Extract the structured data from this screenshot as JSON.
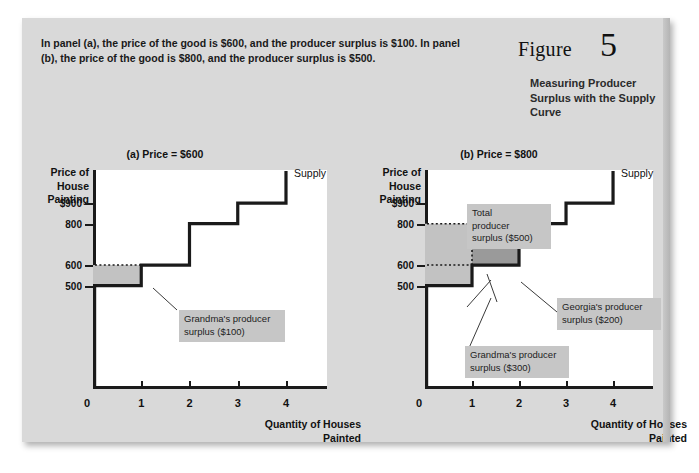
{
  "figure": {
    "label": "Figure",
    "number": "5",
    "title": "Measuring Producer Surplus with the Supply Curve",
    "caption": "In panel (a), the price of the good is $600, and the producer surplus is $100. In panel (b), the price of the good is $800, and the producer surplus is $500."
  },
  "chart_data": [
    {
      "type": "line",
      "title": "(a) Price = $600",
      "xlabel": "Quantity of Houses Painted",
      "ylabel": "Price of House Painting",
      "curve_label": "Supply",
      "xlim": [
        0,
        4.85
      ],
      "ylim": [
        0,
        1060
      ],
      "xticks": [
        "0",
        "1",
        "2",
        "3",
        "4"
      ],
      "xtick_values": [
        0,
        1,
        2,
        3,
        4
      ],
      "yticks": [
        "$900",
        "800",
        "600",
        "500"
      ],
      "ytick_values": [
        900,
        800,
        600,
        500
      ],
      "grid": false,
      "step_series": {
        "name": "Supply",
        "steps": [
          {
            "x_start": 0,
            "x_end": 1,
            "price": 500
          },
          {
            "x_start": 1,
            "x_end": 2,
            "price": 600
          },
          {
            "x_start": 2,
            "x_end": 3,
            "price": 800
          },
          {
            "x_start": 3,
            "x_end": 4,
            "price": 900
          }
        ],
        "vertical_top": 1055
      },
      "market_price": 600,
      "price_line_style": "dotted",
      "shaded_regions": [
        {
          "name": "grandma-surplus",
          "x_start": 0,
          "x_end": 1,
          "y_low": 500,
          "y_high": 600,
          "shade": "light"
        }
      ],
      "annotations": [
        {
          "name": "grandma-callout",
          "text": "Grandma's producer\nsurplus ($100)",
          "value": 100
        }
      ]
    },
    {
      "type": "line",
      "title": "(b) Price = $800",
      "xlabel": "Quantity of Houses Painted",
      "ylabel": "Price of House Painting",
      "curve_label": "Supply",
      "xlim": [
        0,
        4.85
      ],
      "ylim": [
        0,
        1060
      ],
      "xticks": [
        "0",
        "1",
        "2",
        "3",
        "4"
      ],
      "xtick_values": [
        0,
        1,
        2,
        3,
        4
      ],
      "yticks": [
        "$900",
        "800",
        "600",
        "500"
      ],
      "ytick_values": [
        900,
        800,
        600,
        500
      ],
      "grid": false,
      "step_series": {
        "name": "Supply",
        "steps": [
          {
            "x_start": 0,
            "x_end": 1,
            "price": 500
          },
          {
            "x_start": 1,
            "x_end": 2,
            "price": 600
          },
          {
            "x_start": 2,
            "x_end": 3,
            "price": 800
          },
          {
            "x_start": 3,
            "x_end": 4,
            "price": 900
          }
        ],
        "vertical_top": 1055
      },
      "market_price": 800,
      "price_line_style": "dotted",
      "secondary_dotted_price": 600,
      "shaded_regions": [
        {
          "name": "grandma-surplus",
          "x_start": 0,
          "x_end": 1,
          "y_low": 500,
          "y_high": 800,
          "shade": "light"
        },
        {
          "name": "georgia-surplus",
          "x_start": 1,
          "x_end": 2,
          "y_low": 600,
          "y_high": 800,
          "shade": "dark"
        }
      ],
      "annotations": [
        {
          "name": "total-callout",
          "text": "Total\nproducer\nsurplus ($500)",
          "value": 500
        },
        {
          "name": "georgia-callout",
          "text": "Georgia's producer\nsurplus ($200)",
          "value": 200
        },
        {
          "name": "grandma-callout",
          "text": "Grandma's producer\nsurplus ($300)",
          "value": 300
        }
      ]
    }
  ],
  "colors": {
    "card_background": "#d9d9d9",
    "plot_background": "#ffffff",
    "ink": "#1a1a1a",
    "shade_light": "#c2c2c2",
    "shade_dark": "#9a9a9a",
    "callout_background": "#c6c6c6"
  }
}
